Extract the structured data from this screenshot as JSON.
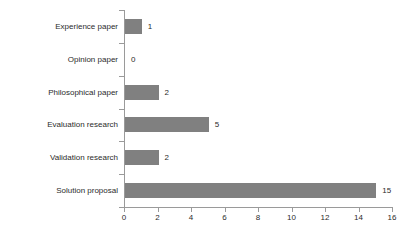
{
  "chart_data": {
    "type": "bar",
    "orientation": "horizontal",
    "title": "",
    "subtitle": "",
    "xlabel": "",
    "ylabel": "",
    "categories": [
      "Experience paper",
      "Opinion paper",
      "Philosophical paper",
      "Evaluation research",
      "Validation research",
      "Solution proposal"
    ],
    "values": [
      1,
      0,
      2,
      5,
      2,
      15
    ],
    "value_labels": [
      "1",
      "0",
      "2",
      "5",
      "2",
      "15"
    ],
    "xlim": [
      0,
      16
    ],
    "xticks": [
      0,
      2,
      4,
      6,
      8,
      10,
      12,
      14,
      16
    ],
    "xtick_labels": [
      "0",
      "2",
      "4",
      "6",
      "8",
      "10",
      "12",
      "14",
      "16"
    ],
    "grid": false,
    "legend": false,
    "series": [
      {
        "name": "Paper count",
        "values": [
          1,
          0,
          2,
          5,
          2,
          15
        ]
      }
    ],
    "colors": {
      "bar": "#808080",
      "axis": "#9a9a9a",
      "text": "#2b2b2b",
      "background": "#ffffff"
    }
  }
}
